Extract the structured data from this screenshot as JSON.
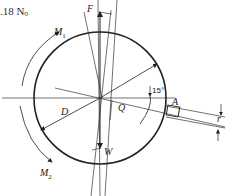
{
  "header_text": ".18 N。",
  "diagram": {
    "labels": {
      "F": "F",
      "M1": "M",
      "M1_sub": "1",
      "M2": "M",
      "M2_sub": "2",
      "D": "D",
      "Q": "Q",
      "W": "W",
      "A": "A",
      "r": "r",
      "angle": "15°"
    },
    "colors": {
      "stroke": "#222222",
      "background": "#ffffff"
    }
  }
}
